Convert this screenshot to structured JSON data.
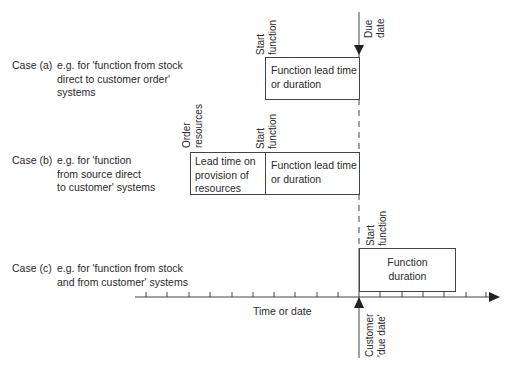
{
  "cases": [
    {
      "name": "Case (a)",
      "description": [
        "e.g. for 'function from stock",
        "direct to customer order'",
        "systems"
      ],
      "markers": [
        {
          "label": [
            "Start",
            "function"
          ]
        }
      ],
      "boxes": [
        {
          "text": [
            "Function lead time",
            "or duration"
          ]
        }
      ]
    },
    {
      "name": "Case (b)",
      "description": [
        "e.g. for 'function",
        "from source direct",
        "to customer' systems"
      ],
      "markers": [
        {
          "label": [
            "Order",
            "resources"
          ]
        },
        {
          "label": [
            "Start",
            "function"
          ]
        }
      ],
      "boxes": [
        {
          "text": [
            "Lead time on",
            "provision of",
            "resources"
          ]
        },
        {
          "text": [
            "Function lead time",
            "or duration"
          ]
        }
      ]
    },
    {
      "name": "Case (c)",
      "description": [
        "e.g. for 'function from stock",
        "and from customer' systems"
      ],
      "markers": [
        {
          "label": [
            "Start",
            "function"
          ]
        }
      ],
      "boxes": [
        {
          "text": [
            "Function",
            "duration"
          ]
        }
      ]
    }
  ],
  "due_date_label": [
    "Due",
    "date"
  ],
  "customer_due_date_label": [
    "Customer",
    "'due date'"
  ],
  "axis": {
    "label": "Time or date",
    "tick_count": 16
  },
  "colors": {
    "line": "#444444",
    "text": "#2a2a2a",
    "background": "#ffffff"
  }
}
